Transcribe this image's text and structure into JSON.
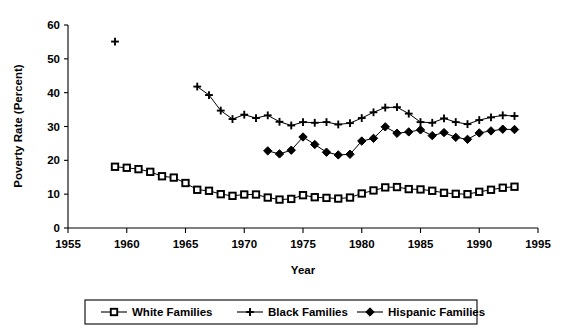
{
  "chart_data": {
    "type": "line",
    "title": "",
    "xlabel": "Year",
    "ylabel": "Poverty Rate (Percent)",
    "xlim": [
      1955,
      1995
    ],
    "ylim": [
      0,
      60
    ],
    "xticks": [
      1955,
      1960,
      1965,
      1970,
      1975,
      1980,
      1985,
      1990,
      1995
    ],
    "yticks": [
      0,
      10,
      20,
      30,
      40,
      50,
      60
    ],
    "grid": false,
    "legend_position": "bottom",
    "series": [
      {
        "name": "White Families",
        "marker": "square",
        "x": [
          1959,
          1960,
          1961,
          1962,
          1963,
          1964,
          1965,
          1966,
          1967,
          1968,
          1969,
          1970,
          1971,
          1972,
          1973,
          1974,
          1975,
          1976,
          1977,
          1978,
          1979,
          1980,
          1981,
          1982,
          1983,
          1984,
          1985,
          1986,
          1987,
          1988,
          1989,
          1990,
          1991,
          1992,
          1993
        ],
        "values": [
          18.1,
          17.8,
          17.4,
          16.6,
          15.3,
          14.9,
          13.3,
          11.3,
          11.0,
          10.0,
          9.5,
          9.9,
          9.9,
          9.0,
          8.4,
          8.6,
          9.7,
          9.1,
          8.9,
          8.7,
          9.0,
          10.2,
          11.1,
          12.0,
          12.1,
          11.5,
          11.4,
          11.0,
          10.4,
          10.1,
          10.0,
          10.7,
          11.3,
          11.9,
          12.2
        ]
      },
      {
        "name": "Black Families",
        "marker": "plus",
        "x": [
          1959,
          1966,
          1967,
          1968,
          1969,
          1970,
          1971,
          1972,
          1973,
          1974,
          1975,
          1976,
          1977,
          1978,
          1979,
          1980,
          1981,
          1982,
          1983,
          1984,
          1985,
          1986,
          1987,
          1988,
          1989,
          1990,
          1991,
          1992,
          1993
        ],
        "values": [
          55.1,
          41.8,
          39.3,
          34.7,
          32.2,
          33.5,
          32.5,
          33.3,
          31.4,
          30.3,
          31.3,
          31.1,
          31.3,
          30.6,
          31.0,
          32.5,
          34.2,
          35.6,
          35.7,
          33.8,
          31.3,
          31.1,
          32.4,
          31.3,
          30.7,
          31.9,
          32.7,
          33.3,
          33.1
        ]
      },
      {
        "name": "Hispanic Families",
        "marker": "diamond",
        "x": [
          1972,
          1973,
          1974,
          1975,
          1976,
          1977,
          1978,
          1979,
          1980,
          1981,
          1982,
          1983,
          1984,
          1985,
          1986,
          1987,
          1988,
          1989,
          1990,
          1991,
          1992,
          1993
        ],
        "values": [
          22.8,
          21.9,
          23.0,
          26.9,
          24.7,
          22.4,
          21.6,
          21.8,
          25.7,
          26.5,
          29.9,
          28.0,
          28.4,
          29.0,
          27.3,
          28.2,
          26.8,
          26.2,
          28.1,
          28.7,
          29.2,
          29.1
        ]
      }
    ]
  },
  "legend": {
    "items": [
      {
        "label": "White Families",
        "marker": "square"
      },
      {
        "label": "Black Families",
        "marker": "plus"
      },
      {
        "label": "Hispanic Families",
        "marker": "diamond"
      }
    ]
  },
  "colors": {
    "series": "#000000",
    "axis": "#000000",
    "background": "#ffffff"
  }
}
